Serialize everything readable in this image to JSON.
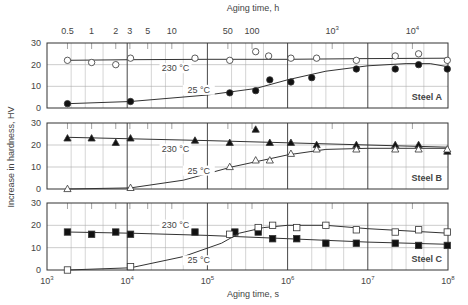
{
  "chart_data": {
    "type": "scatter",
    "title": "",
    "xlabel": "Aging time, s",
    "x2label": "Aging time, h",
    "ylabel": "Increase in hardness, HV",
    "xscale": "log",
    "xlim": [
      1000,
      100000000
    ],
    "ylim": [
      0,
      30
    ],
    "grid": true,
    "x_ticks": [
      {
        "value": 1000,
        "label": "10",
        "exp": "3"
      },
      {
        "value": 10000,
        "label": "10",
        "exp": "4"
      },
      {
        "value": 100000,
        "label": "10",
        "exp": "5"
      },
      {
        "value": 1000000,
        "label": "10",
        "exp": "6"
      },
      {
        "value": 10000000,
        "label": "10",
        "exp": "7"
      },
      {
        "value": 100000000,
        "label": "10",
        "exp": "8"
      }
    ],
    "x2_ticks": [
      {
        "hours": 0.5,
        "label": "0.5"
      },
      {
        "hours": 1,
        "label": "1"
      },
      {
        "hours": 2,
        "label": "2"
      },
      {
        "hours": 3,
        "label": "3"
      },
      {
        "hours": 5,
        "label": "5"
      },
      {
        "hours": 10,
        "label": "10"
      },
      {
        "hours": 50,
        "label": "50"
      },
      {
        "hours": 100,
        "label": "100"
      },
      {
        "hours": 1000,
        "label": "10",
        "exp": "3"
      },
      {
        "hours": 10000,
        "label": "10",
        "exp": "4"
      }
    ],
    "y_ticks": [
      0,
      10,
      20,
      30
    ],
    "panels": [
      {
        "name": "Steel A",
        "series": [
          {
            "name": "230 °C",
            "marker": "circle-open",
            "label_pos": [
              40000,
              17
            ],
            "points": [
              [
                1800,
                22
              ],
              [
                3600,
                21
              ],
              [
                7200,
                20
              ],
              [
                11000,
                23
              ],
              [
                70000,
                23
              ],
              [
                190000,
                22
              ],
              [
                400000,
                26
              ],
              [
                580000,
                24
              ],
              [
                1100000,
                23
              ],
              [
                2300000,
                23
              ],
              [
                7200000,
                22
              ],
              [
                22000000,
                24
              ],
              [
                43000000,
                25
              ],
              [
                98000000,
                22
              ]
            ],
            "curve": [
              [
                1800,
                22
              ],
              [
                11000,
                22.3
              ],
              [
                100000,
                22.5
              ],
              [
                1000000,
                22.5
              ],
              [
                10000000,
                22.8
              ],
              [
                100000000,
                23
              ]
            ]
          },
          {
            "name": "25 °C",
            "marker": "circle-filled",
            "label_pos": [
              78000,
              7
            ],
            "points": [
              [
                1800,
                2
              ],
              [
                11000,
                3
              ],
              [
                190000,
                7
              ],
              [
                400000,
                8
              ],
              [
                600000,
                13
              ],
              [
                1100000,
                12
              ],
              [
                2000000,
                14
              ],
              [
                7200000,
                18
              ],
              [
                22000000,
                18
              ],
              [
                43000000,
                20
              ],
              [
                98000000,
                18
              ]
            ],
            "curve": [
              [
                1800,
                2
              ],
              [
                11000,
                3
              ],
              [
                100000,
                6
              ],
              [
                400000,
                9
              ],
              [
                1000000,
                13
              ],
              [
                3000000,
                17
              ],
              [
                10000000,
                19.5
              ],
              [
                30000000,
                20.5
              ],
              [
                60000000,
                20.5
              ],
              [
                100000000,
                19
              ]
            ]
          }
        ]
      },
      {
        "name": "Steel B",
        "series": [
          {
            "name": "230 °C",
            "marker": "triangle-filled",
            "label_pos": [
              40000,
              17
            ],
            "points": [
              [
                1800,
                23
              ],
              [
                3600,
                23
              ],
              [
                7200,
                21
              ],
              [
                11000,
                23
              ],
              [
                70000,
                22
              ],
              [
                190000,
                21
              ],
              [
                400000,
                27
              ],
              [
                600000,
                21
              ],
              [
                1100000,
                21
              ],
              [
                2300000,
                20
              ],
              [
                7200000,
                20
              ],
              [
                22000000,
                20
              ],
              [
                43000000,
                20
              ],
              [
                98000000,
                17
              ]
            ],
            "curve": [
              [
                1800,
                23.5
              ],
              [
                100000,
                22
              ],
              [
                1000000,
                21
              ],
              [
                10000000,
                20
              ],
              [
                100000000,
                19
              ]
            ]
          },
          {
            "name": "25 °C",
            "marker": "triangle-open",
            "label_pos": [
              78000,
              7
            ],
            "points": [
              [
                1800,
                0
              ],
              [
                11000,
                0.5
              ],
              [
                190000,
                10
              ],
              [
                400000,
                13
              ],
              [
                600000,
                13
              ],
              [
                1100000,
                16
              ],
              [
                2300000,
                18
              ],
              [
                7200000,
                18
              ],
              [
                22000000,
                18
              ],
              [
                43000000,
                18
              ],
              [
                98000000,
                18
              ]
            ],
            "curve": [
              [
                1800,
                0
              ],
              [
                11000,
                0.5
              ],
              [
                50000,
                4
              ],
              [
                200000,
                10
              ],
              [
                1000000,
                15.5
              ],
              [
                3000000,
                18
              ],
              [
                10000000,
                18.5
              ],
              [
                100000000,
                18.5
              ]
            ]
          }
        ]
      },
      {
        "name": "Steel C",
        "series": [
          {
            "name": "230 °C",
            "marker": "square-filled",
            "label_pos": [
              40000,
              19
            ],
            "points": [
              [
                1800,
                17
              ],
              [
                3600,
                16
              ],
              [
                7200,
                17
              ],
              [
                11000,
                16
              ],
              [
                70000,
                17
              ],
              [
                220000,
                17
              ],
              [
                430000,
                17
              ],
              [
                650000,
                14
              ],
              [
                1300000,
                14
              ],
              [
                3000000,
                12
              ],
              [
                7200000,
                12
              ],
              [
                22000000,
                12
              ],
              [
                43000000,
                11
              ],
              [
                98000000,
                11
              ]
            ],
            "curve": [
              [
                1800,
                17
              ],
              [
                11000,
                16.5
              ],
              [
                100000,
                15.5
              ],
              [
                1000000,
                14
              ],
              [
                10000000,
                12.5
              ],
              [
                100000000,
                11.5
              ]
            ]
          },
          {
            "name": "25 °C",
            "marker": "square-open",
            "label_pos": [
              78000,
              3
            ],
            "points": [
              [
                1800,
                0
              ],
              [
                11000,
                1.5
              ],
              [
                190000,
                16
              ],
              [
                430000,
                19
              ],
              [
                650000,
                20
              ],
              [
                1300000,
                19
              ],
              [
                3000000,
                20
              ],
              [
                7200000,
                18
              ],
              [
                22000000,
                17
              ],
              [
                43000000,
                18
              ],
              [
                98000000,
                17
              ]
            ],
            "curve": [
              [
                1800,
                0
              ],
              [
                11000,
                1
              ],
              [
                50000,
                6
              ],
              [
                150000,
                12
              ],
              [
                250000,
                16.5
              ],
              [
                500000,
                19
              ],
              [
                1000000,
                20
              ],
              [
                3000000,
                20
              ],
              [
                10000000,
                18.5
              ],
              [
                100000000,
                16.5
              ]
            ]
          }
        ]
      }
    ]
  }
}
